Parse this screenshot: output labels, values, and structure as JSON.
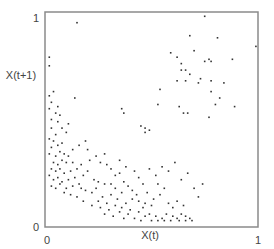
{
  "chart_data": {
    "type": "scatter",
    "title": "",
    "xlabel": "X(t)",
    "ylabel": "X(t+1)",
    "xlim": [
      0,
      1
    ],
    "ylim": [
      0,
      1
    ],
    "x_ticks": [
      "0",
      "1"
    ],
    "y_ticks": [
      "0",
      "1"
    ],
    "grid": false,
    "legend": null,
    "frame": "box",
    "series": [
      {
        "name": "points",
        "marker_color": "#333333",
        "points": [
          [
            0.75,
            0.98
          ],
          [
            0.68,
            0.89
          ],
          [
            0.81,
            0.88
          ],
          [
            0.99,
            0.84
          ],
          [
            0.59,
            0.81
          ],
          [
            0.62,
            0.79
          ],
          [
            0.7,
            0.82
          ],
          [
            0.75,
            0.77
          ],
          [
            0.77,
            0.78
          ],
          [
            0.78,
            0.77
          ],
          [
            0.88,
            0.78
          ],
          [
            0.64,
            0.76
          ],
          [
            0.64,
            0.73
          ],
          [
            0.66,
            0.73
          ],
          [
            0.68,
            0.71
          ],
          [
            0.73,
            0.69
          ],
          [
            0.62,
            0.68
          ],
          [
            0.66,
            0.68
          ],
          [
            0.72,
            0.67
          ],
          [
            0.78,
            0.68
          ],
          [
            0.84,
            0.67
          ],
          [
            0.78,
            0.63
          ],
          [
            0.82,
            0.6
          ],
          [
            0.54,
            0.64
          ],
          [
            0.8,
            0.57
          ],
          [
            0.63,
            0.56
          ],
          [
            0.89,
            0.56
          ],
          [
            0.65,
            0.53
          ],
          [
            0.67,
            0.53
          ],
          [
            0.77,
            0.51
          ],
          [
            0.15,
            0.95
          ],
          [
            0.02,
            0.79
          ],
          [
            0.02,
            0.75
          ],
          [
            0.14,
            0.6
          ],
          [
            0.45,
            0.47
          ],
          [
            0.47,
            0.46
          ],
          [
            0.49,
            0.45
          ],
          [
            0.47,
            0.44
          ],
          [
            0.36,
            0.55
          ],
          [
            0.37,
            0.53
          ],
          [
            0.53,
            0.57
          ],
          [
            0.2,
            0.36
          ],
          [
            0.02,
            0.61
          ],
          [
            0.03,
            0.58
          ],
          [
            0.02,
            0.55
          ],
          [
            0.05,
            0.53
          ],
          [
            0.07,
            0.52
          ],
          [
            0.03,
            0.5
          ],
          [
            0.06,
            0.49
          ],
          [
            0.1,
            0.44
          ],
          [
            0.03,
            0.46
          ],
          [
            0.05,
            0.43
          ],
          [
            0.02,
            0.41
          ],
          [
            0.04,
            0.4
          ],
          [
            0.03,
            0.37
          ],
          [
            0.06,
            0.38
          ],
          [
            0.08,
            0.39
          ],
          [
            0.02,
            0.34
          ],
          [
            0.05,
            0.33
          ],
          [
            0.07,
            0.35
          ],
          [
            0.09,
            0.34
          ],
          [
            0.11,
            0.33
          ],
          [
            0.04,
            0.3
          ],
          [
            0.06,
            0.29
          ],
          [
            0.08,
            0.31
          ],
          [
            0.1,
            0.3
          ],
          [
            0.13,
            0.3
          ],
          [
            0.03,
            0.27
          ],
          [
            0.05,
            0.26
          ],
          [
            0.07,
            0.27
          ],
          [
            0.09,
            0.25
          ],
          [
            0.12,
            0.26
          ],
          [
            0.02,
            0.24
          ],
          [
            0.04,
            0.22
          ],
          [
            0.06,
            0.23
          ],
          [
            0.08,
            0.21
          ],
          [
            0.11,
            0.22
          ],
          [
            0.14,
            0.23
          ],
          [
            0.03,
            0.19
          ],
          [
            0.05,
            0.18
          ],
          [
            0.07,
            0.2
          ],
          [
            0.1,
            0.18
          ],
          [
            0.13,
            0.19
          ],
          [
            0.16,
            0.2
          ],
          [
            0.18,
            0.24
          ],
          [
            0.2,
            0.26
          ],
          [
            0.23,
            0.22
          ],
          [
            0.25,
            0.21
          ],
          [
            0.17,
            0.18
          ],
          [
            0.19,
            0.17
          ],
          [
            0.22,
            0.16
          ],
          [
            0.24,
            0.18
          ],
          [
            0.28,
            0.2
          ],
          [
            0.31,
            0.15
          ],
          [
            0.27,
            0.14
          ],
          [
            0.34,
            0.13
          ],
          [
            0.38,
            0.11
          ],
          [
            0.29,
            0.11
          ],
          [
            0.33,
            0.1
          ],
          [
            0.36,
            0.09
          ],
          [
            0.4,
            0.08
          ],
          [
            0.44,
            0.07
          ],
          [
            0.46,
            0.09
          ],
          [
            0.49,
            0.06
          ],
          [
            0.52,
            0.05
          ],
          [
            0.55,
            0.04
          ],
          [
            0.57,
            0.06
          ],
          [
            0.6,
            0.05
          ],
          [
            0.62,
            0.04
          ],
          [
            0.64,
            0.06
          ],
          [
            0.66,
            0.05
          ],
          [
            0.68,
            0.04
          ],
          [
            0.5,
            0.03
          ],
          [
            0.53,
            0.03
          ],
          [
            0.56,
            0.03
          ],
          [
            0.59,
            0.03
          ],
          [
            0.63,
            0.03
          ],
          [
            0.66,
            0.03
          ],
          [
            0.69,
            0.03
          ],
          [
            0.42,
            0.04
          ],
          [
            0.45,
            0.03
          ],
          [
            0.47,
            0.05
          ],
          [
            0.39,
            0.06
          ],
          [
            0.37,
            0.04
          ],
          [
            0.35,
            0.07
          ],
          [
            0.32,
            0.05
          ],
          [
            0.3,
            0.08
          ],
          [
            0.26,
            0.09
          ],
          [
            0.22,
            0.1
          ],
          [
            0.18,
            0.12
          ],
          [
            0.15,
            0.14
          ],
          [
            0.12,
            0.15
          ],
          [
            0.09,
            0.16
          ],
          [
            0.26,
            0.3
          ],
          [
            0.29,
            0.29
          ],
          [
            0.31,
            0.27
          ],
          [
            0.33,
            0.24
          ],
          [
            0.35,
            0.25
          ],
          [
            0.37,
            0.21
          ],
          [
            0.39,
            0.19
          ],
          [
            0.41,
            0.17
          ],
          [
            0.43,
            0.15
          ],
          [
            0.41,
            0.13
          ],
          [
            0.44,
            0.12
          ],
          [
            0.47,
            0.11
          ],
          [
            0.5,
            0.1
          ],
          [
            0.51,
            0.13
          ],
          [
            0.54,
            0.15
          ],
          [
            0.56,
            0.18
          ],
          [
            0.53,
            0.2
          ],
          [
            0.58,
            0.11
          ],
          [
            0.6,
            0.09
          ],
          [
            0.48,
            0.16
          ],
          [
            0.46,
            0.2
          ],
          [
            0.44,
            0.23
          ],
          [
            0.42,
            0.26
          ],
          [
            0.38,
            0.28
          ],
          [
            0.35,
            0.31
          ],
          [
            0.28,
            0.34
          ],
          [
            0.24,
            0.33
          ],
          [
            0.21,
            0.31
          ],
          [
            0.17,
            0.29
          ],
          [
            0.15,
            0.27
          ],
          [
            0.19,
            0.4
          ],
          [
            0.16,
            0.38
          ],
          [
            0.13,
            0.36
          ],
          [
            0.11,
            0.48
          ],
          [
            0.08,
            0.46
          ],
          [
            0.04,
            0.63
          ],
          [
            0.06,
            0.56
          ],
          [
            0.25,
            0.12
          ],
          [
            0.28,
            0.06
          ],
          [
            0.33,
            0.18
          ],
          [
            0.36,
            0.16
          ],
          [
            0.31,
            0.2
          ],
          [
            0.58,
            0.26
          ],
          [
            0.55,
            0.28
          ],
          [
            0.61,
            0.3
          ],
          [
            0.64,
            0.22
          ],
          [
            0.67,
            0.25
          ],
          [
            0.7,
            0.18
          ],
          [
            0.72,
            0.14
          ],
          [
            0.74,
            0.2
          ],
          [
            0.62,
            0.12
          ],
          [
            0.65,
            0.1
          ],
          [
            0.52,
            0.24
          ],
          [
            0.49,
            0.27
          ]
        ]
      }
    ]
  },
  "axes": {
    "x_label": "X(t)",
    "y_label": "X(t+1)",
    "x_tick_0": "0",
    "x_tick_1": "1",
    "y_tick_0": "0",
    "y_tick_1": "1"
  }
}
